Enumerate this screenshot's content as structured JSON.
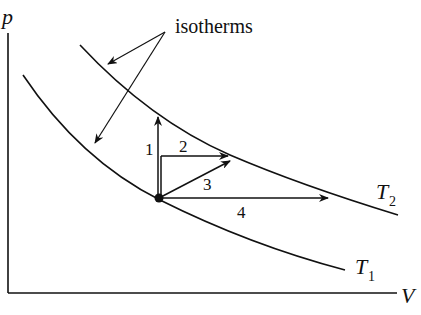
{
  "diagram": {
    "type": "pV-diagram",
    "axes": {
      "y_label": "p",
      "x_label": "V"
    },
    "annotation": "isotherms",
    "isotherms": [
      {
        "name": "T1",
        "label_main": "T",
        "label_sub": "1",
        "position": "lower"
      },
      {
        "name": "T2",
        "label_main": "T",
        "label_sub": "2",
        "position": "upper"
      }
    ],
    "state_point": "common starting point on T1",
    "paths": [
      {
        "id": "1",
        "label": "1",
        "direction": "vertical up (constant V)"
      },
      {
        "id": "2",
        "label": "2",
        "direction": "horizontal (constant p)"
      },
      {
        "id": "3",
        "label": "3",
        "direction": "diagonal"
      },
      {
        "id": "4",
        "label": "4",
        "direction": "horizontal to T2 (constant p)"
      }
    ],
    "colors": {
      "ink": "#111111",
      "background": "#ffffff"
    }
  }
}
